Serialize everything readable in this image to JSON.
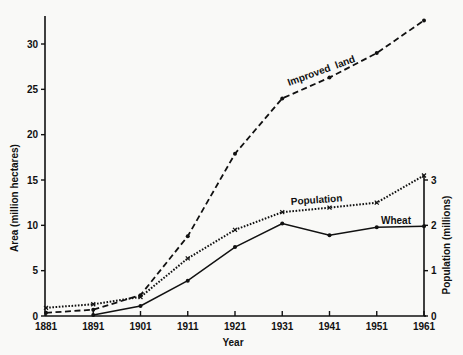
{
  "chart_data": {
    "type": "line",
    "title": "",
    "xlabel": "Year",
    "ylabel": "Area (million hectares)",
    "y2label": "Population (millions)",
    "x": [
      1881,
      1891,
      1901,
      1911,
      1921,
      1931,
      1941,
      1951,
      1961
    ],
    "xticks": [
      "1881",
      "1891",
      "1901",
      "1911",
      "1921",
      "1931",
      "1941",
      "1951",
      "1961"
    ],
    "ylim": [
      0,
      33
    ],
    "yticks": [
      "0",
      "5",
      "10",
      "15",
      "20",
      "25",
      "30"
    ],
    "y2lim": [
      0,
      6.6
    ],
    "y2ticks": [
      "0",
      "1",
      "2",
      "3"
    ],
    "grid": false,
    "legend": "inline labels",
    "series": [
      {
        "name": "Improved land",
        "axis": "left",
        "style": "dashed",
        "marker": "dot",
        "values": [
          0.35,
          0.7,
          2.3,
          8.8,
          17.9,
          24.0,
          26.3,
          29.0,
          32.6
        ]
      },
      {
        "name": "Population",
        "axis": "right",
        "style": "dotted",
        "marker": "x",
        "values": [
          0.18,
          0.26,
          0.42,
          1.27,
          1.9,
          2.29,
          2.39,
          2.5,
          3.1
        ]
      },
      {
        "name": "Wheat",
        "axis": "left",
        "style": "solid",
        "marker": "dot",
        "values": [
          0.0,
          0.1,
          1.1,
          3.9,
          7.6,
          10.2,
          8.9,
          9.8,
          9.9
        ]
      }
    ],
    "annotations": [
      {
        "text": "Improved  land",
        "series": "Improved land"
      },
      {
        "text": "Population",
        "series": "Population"
      },
      {
        "text": "Wheat",
        "series": "Wheat"
      }
    ]
  }
}
